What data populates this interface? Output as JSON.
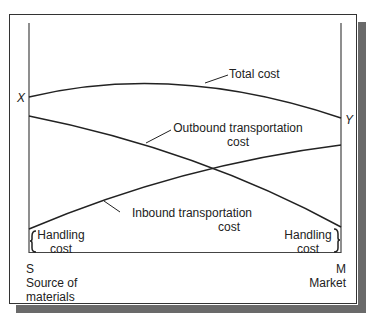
{
  "diagram": {
    "axis_labels": {
      "left_top": "X",
      "right_top": "Y",
      "left_bottom_code": "S",
      "left_bottom_name_line1": "Source of",
      "left_bottom_name_line2": "materials",
      "right_bottom_code": "M",
      "right_bottom_name": "Market"
    },
    "curves": {
      "total": "Total cost",
      "outbound_line1": "Outbound transportation",
      "outbound_line2": "cost",
      "inbound_line1": "Inbound transportation",
      "inbound_line2": "cost"
    },
    "handling_left_line1": "Handling",
    "handling_left_line2": "cost",
    "handling_right_line1": "Handling",
    "handling_right_line2": "cost"
  }
}
